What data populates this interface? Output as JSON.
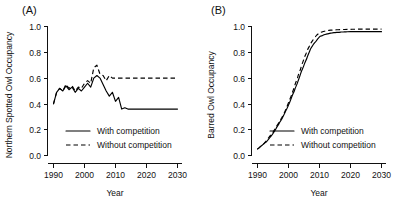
{
  "figure": {
    "panels": [
      {
        "label": "(A)",
        "ylabel": "Northern Spotted Owl Occupancy",
        "xlabel": "Year"
      },
      {
        "label": "(B)",
        "ylabel": "Barred Owl Occupancy",
        "xlabel": "Year"
      }
    ],
    "legend": {
      "with": "With competition",
      "without": "Without competition"
    },
    "xticklabels": [
      "1990",
      "2000",
      "2010",
      "2020",
      "2030"
    ],
    "yticklabels": [
      "0.0",
      "0.2",
      "0.4",
      "0.6",
      "0.8",
      "1.0"
    ]
  },
  "chart_data": [
    {
      "type": "line",
      "title": "(A)",
      "xlabel": "Year",
      "ylabel": "Northern Spotted Owl Occupancy",
      "xlim": [
        1988,
        2031
      ],
      "ylim": [
        0.0,
        1.0
      ],
      "xticks": [
        1990,
        2000,
        2010,
        2020,
        2030
      ],
      "yticks": [
        0.0,
        0.2,
        0.4,
        0.6,
        0.8,
        1.0
      ],
      "grid": false,
      "legend_position": "lower-center",
      "x": [
        1990,
        1991,
        1992,
        1993,
        1994,
        1995,
        1996,
        1997,
        1998,
        1999,
        2000,
        2001,
        2002,
        2003,
        2004,
        2005,
        2006,
        2007,
        2008,
        2009,
        2010,
        2011,
        2012,
        2013,
        2014,
        2015,
        2016,
        2017,
        2018,
        2019,
        2020,
        2021,
        2022,
        2023,
        2024,
        2025,
        2026,
        2027,
        2028,
        2029,
        2030
      ],
      "series": [
        {
          "name": "With competition",
          "style": "solid",
          "values": [
            0.4,
            0.49,
            0.52,
            0.5,
            0.54,
            0.51,
            0.53,
            0.49,
            0.52,
            0.5,
            0.53,
            0.56,
            0.53,
            0.6,
            0.62,
            0.6,
            0.55,
            0.5,
            0.46,
            0.49,
            0.42,
            0.45,
            0.36,
            0.37,
            0.36,
            0.36,
            0.36,
            0.36,
            0.36,
            0.36,
            0.36,
            0.36,
            0.36,
            0.36,
            0.36,
            0.36,
            0.36,
            0.36,
            0.36,
            0.36,
            0.36
          ]
        },
        {
          "name": "Without competition",
          "style": "dashed",
          "values": [
            0.4,
            0.49,
            0.52,
            0.5,
            0.55,
            0.52,
            0.54,
            0.5,
            0.53,
            0.52,
            0.56,
            0.58,
            0.56,
            0.68,
            0.7,
            0.63,
            0.62,
            0.58,
            0.62,
            0.6,
            0.6,
            0.6,
            0.6,
            0.6,
            0.6,
            0.6,
            0.6,
            0.6,
            0.6,
            0.6,
            0.6,
            0.6,
            0.6,
            0.6,
            0.6,
            0.6,
            0.6,
            0.6,
            0.6,
            0.6,
            0.6
          ]
        }
      ]
    },
    {
      "type": "line",
      "title": "(B)",
      "xlabel": "Year",
      "ylabel": "Barred Owl Occupancy",
      "xlim": [
        1988,
        2031
      ],
      "ylim": [
        0.0,
        1.0
      ],
      "xticks": [
        1990,
        2000,
        2010,
        2020,
        2030
      ],
      "yticks": [
        0.0,
        0.2,
        0.4,
        0.6,
        0.8,
        1.0
      ],
      "grid": false,
      "legend_position": "lower-center",
      "x": [
        1990,
        1991,
        1992,
        1993,
        1994,
        1995,
        1996,
        1997,
        1998,
        1999,
        2000,
        2001,
        2002,
        2003,
        2004,
        2005,
        2006,
        2007,
        2008,
        2009,
        2010,
        2011,
        2012,
        2013,
        2014,
        2015,
        2016,
        2017,
        2018,
        2019,
        2020,
        2021,
        2022,
        2023,
        2024,
        2025,
        2026,
        2027,
        2028,
        2029,
        2030
      ],
      "series": [
        {
          "name": "With competition",
          "style": "solid",
          "values": [
            0.05,
            0.07,
            0.09,
            0.11,
            0.14,
            0.17,
            0.21,
            0.25,
            0.29,
            0.34,
            0.39,
            0.45,
            0.51,
            0.57,
            0.64,
            0.7,
            0.76,
            0.82,
            0.86,
            0.89,
            0.92,
            0.93,
            0.94,
            0.945,
            0.95,
            0.953,
            0.955,
            0.957,
            0.958,
            0.959,
            0.96,
            0.96,
            0.96,
            0.96,
            0.96,
            0.96,
            0.96,
            0.96,
            0.96,
            0.96,
            0.96
          ]
        },
        {
          "name": "Without competition",
          "style": "dashed",
          "values": [
            0.05,
            0.07,
            0.09,
            0.12,
            0.15,
            0.18,
            0.22,
            0.26,
            0.3,
            0.35,
            0.41,
            0.47,
            0.54,
            0.61,
            0.68,
            0.75,
            0.81,
            0.86,
            0.9,
            0.93,
            0.95,
            0.96,
            0.965,
            0.97,
            0.972,
            0.974,
            0.975,
            0.976,
            0.977,
            0.978,
            0.978,
            0.979,
            0.979,
            0.98,
            0.98,
            0.98,
            0.98,
            0.98,
            0.98,
            0.98,
            0.98
          ]
        }
      ]
    }
  ]
}
